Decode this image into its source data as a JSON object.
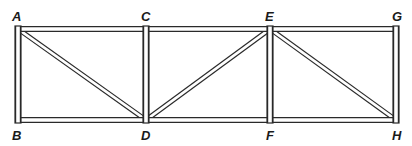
{
  "diagram": {
    "type": "truss",
    "joints": [
      {
        "id": "A",
        "label": "A",
        "x": 18,
        "y": 29,
        "label_x": 12,
        "label_y": 10
      },
      {
        "id": "B",
        "label": "B",
        "x": 18,
        "y": 120,
        "label_x": 12,
        "label_y": 129
      },
      {
        "id": "C",
        "label": "C",
        "x": 146,
        "y": 29,
        "label_x": 141,
        "label_y": 10
      },
      {
        "id": "D",
        "label": "D",
        "x": 146,
        "y": 120,
        "label_x": 141,
        "label_y": 129
      },
      {
        "id": "E",
        "label": "E",
        "x": 270,
        "y": 29,
        "label_x": 265,
        "label_y": 10
      },
      {
        "id": "F",
        "label": "F",
        "x": 270,
        "y": 120,
        "label_x": 266,
        "label_y": 129
      },
      {
        "id": "G",
        "label": "G",
        "x": 396,
        "y": 29,
        "label_x": 392,
        "label_y": 10
      },
      {
        "id": "H",
        "label": "H",
        "x": 396,
        "y": 120,
        "label_x": 392,
        "label_y": 129
      }
    ],
    "members": [
      {
        "from": "A",
        "to": "C",
        "kind": "top-chord"
      },
      {
        "from": "C",
        "to": "E",
        "kind": "top-chord"
      },
      {
        "from": "E",
        "to": "G",
        "kind": "top-chord"
      },
      {
        "from": "B",
        "to": "D",
        "kind": "bottom-chord"
      },
      {
        "from": "D",
        "to": "F",
        "kind": "bottom-chord"
      },
      {
        "from": "F",
        "to": "H",
        "kind": "bottom-chord"
      },
      {
        "from": "A",
        "to": "B",
        "kind": "vertical"
      },
      {
        "from": "C",
        "to": "D",
        "kind": "vertical"
      },
      {
        "from": "E",
        "to": "F",
        "kind": "vertical"
      },
      {
        "from": "G",
        "to": "H",
        "kind": "vertical"
      },
      {
        "from": "A",
        "to": "D",
        "kind": "diagonal"
      },
      {
        "from": "D",
        "to": "E",
        "kind": "diagonal"
      },
      {
        "from": "E",
        "to": "H",
        "kind": "diagonal"
      }
    ],
    "colors": {
      "stroke": "#2a2a2a",
      "fill": "#ffffff",
      "background": "#ffffff"
    }
  }
}
